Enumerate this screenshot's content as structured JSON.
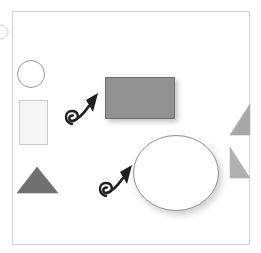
{
  "scene": {
    "title": "abstract-shape-scene",
    "width": 261,
    "height": 253,
    "background_color": "#ffffff",
    "frame": {
      "label": "frame-border",
      "x": 12,
      "y": 11,
      "width": 238,
      "height": 234,
      "stroke_color": "#d0d0d0",
      "fill_color": "#ffffff",
      "stroke_width": 1
    },
    "shapes": [
      {
        "id": "edge-partial-circle",
        "name": "partial-circle-left-edge",
        "type": "circle",
        "cx": 1,
        "cy": 32,
        "r": 7,
        "fill_color": "#ffffff",
        "stroke_color": "#cccccc",
        "note": "clipped at left image edge"
      },
      {
        "id": "outline-circle",
        "name": "outline-circle-small",
        "type": "circle",
        "cx": 31,
        "cy": 74,
        "r": 14,
        "fill_color": "#ffffff",
        "stroke_color": "#9a9a9a"
      },
      {
        "id": "light-rectangle",
        "name": "light-gray-rectangle",
        "type": "rect",
        "x": 19,
        "y": 100,
        "width": 29,
        "height": 45,
        "fill_color": "#f4f4f4",
        "stroke_color": "#c8c8c8"
      },
      {
        "id": "dark-triangle",
        "name": "dark-gray-triangle-up",
        "type": "triangle",
        "points": "37,167 58,193 17,193",
        "fill_color": "#707070",
        "stroke_color": "#707070"
      },
      {
        "id": "gray-rectangle",
        "name": "gray-filled-rectangle",
        "type": "rect",
        "x": 105,
        "y": 77,
        "width": 70,
        "height": 42,
        "fill_color": "#919191",
        "stroke_color": "#6e6e6e",
        "shadow": true
      },
      {
        "id": "big-ellipse",
        "name": "large-white-ellipse",
        "type": "ellipse",
        "cx": 176,
        "cy": 173,
        "rx": 43,
        "ry": 38,
        "fill_color": "#ffffff",
        "stroke_color": "#8e8e8e",
        "shadow": true
      },
      {
        "id": "right-triangle-top",
        "name": "right-triangle-upper",
        "type": "triangle",
        "points": "250,104 250,135 230,135",
        "fill_color": "#a8a8a8",
        "stroke_color": "#a8a8a8"
      },
      {
        "id": "right-triangle-bottom",
        "name": "right-triangle-lower",
        "type": "triangle",
        "points": "230,147 250,178 230,178",
        "fill_color": "#b0b0b0",
        "stroke_color": "#b0b0b0"
      }
    ],
    "arrows": [
      {
        "id": "curly-arrow-upper",
        "name": "curly-arrow-upper-left",
        "color": "#1f1f1f",
        "tail_loop_cx": 74,
        "tail_loop_cy": 117,
        "tail_loop_r": 6,
        "tip_x": 98,
        "tip_y": 94,
        "direction": "up-right"
      },
      {
        "id": "curly-arrow-lower",
        "name": "curly-arrow-lower-center",
        "color": "#1f1f1f",
        "tail_loop_cx": 108,
        "tail_loop_cy": 189,
        "tail_loop_r": 6,
        "tip_x": 132,
        "tip_y": 165,
        "direction": "up-right"
      }
    ]
  }
}
